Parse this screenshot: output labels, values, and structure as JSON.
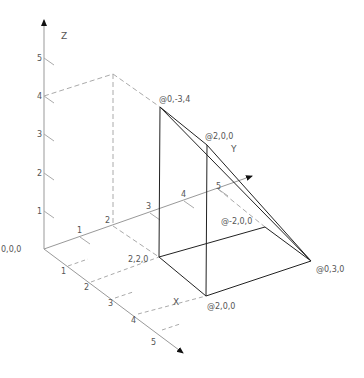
{
  "diagram": {
    "type": "isometric-3d-wireframe",
    "axes": {
      "x": {
        "label": "X",
        "ticks": [
          "1",
          "2",
          "3",
          "4",
          "5"
        ]
      },
      "y": {
        "label": "Y",
        "ticks": [
          "1",
          "2",
          "3",
          "4",
          "5"
        ]
      },
      "z": {
        "label": "Z",
        "ticks": [
          "1",
          "2",
          "3",
          "4",
          "5"
        ]
      },
      "origin_label": "0,0,0"
    },
    "point_labels": {
      "apex": "@0,-3,4",
      "top_mid": "@2,0,0",
      "y_end": "@0,3,0",
      "back": "@-2,0,0",
      "base_corner": "2,2,0",
      "bottom_front": "@2,0,0"
    },
    "colors": {
      "solid_line": "#222222",
      "axis_line": "#999999",
      "dashed_line": "#aaaaaa",
      "text": "#555555"
    }
  }
}
